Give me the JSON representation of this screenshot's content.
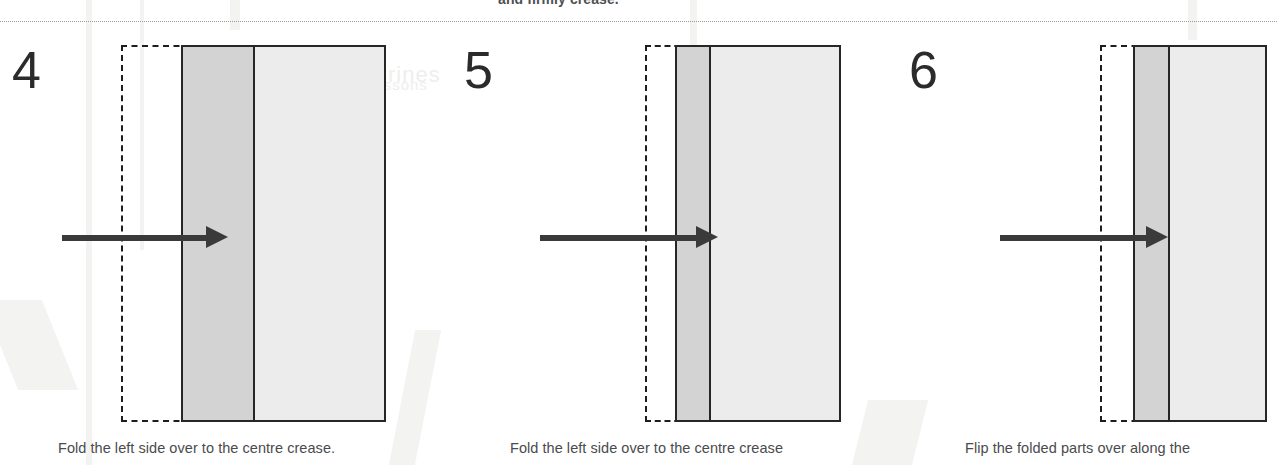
{
  "header": {
    "continued_text": "and firmly crease.",
    "separator": "dotted-rule"
  },
  "panels": [
    {
      "number": "4",
      "caption": "Fold the left side over to the centre crease.",
      "arrow": "right-arrow",
      "flap_fill": "#d3d3d3",
      "face_fill": "#ececec",
      "outline": "#262626"
    },
    {
      "number": "5",
      "caption": "Fold the left side over to the centre crease",
      "arrow": "right-arrow",
      "flap_fill": "#d3d3d3",
      "face_fill": "#ececec",
      "outline": "#262626"
    },
    {
      "number": "6",
      "caption": "Flip the folded parts over along the",
      "arrow": "right-arrow",
      "flap_fill": "#d3d3d3",
      "face_fill": "#ececec",
      "outline": "#262626"
    }
  ]
}
